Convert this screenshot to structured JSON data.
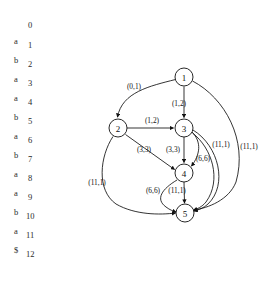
{
  "figure": {
    "background_color": "#ffffff",
    "ink_color": "#111111"
  },
  "string_column": {
    "indices": [
      "0",
      "1",
      "2",
      "3",
      "4",
      "5",
      "6",
      "7",
      "8",
      "9",
      "10",
      "11",
      "12"
    ],
    "characters": [
      "a",
      "b",
      "a",
      "a",
      "b",
      "a",
      "b",
      "a",
      "a",
      "b",
      "a",
      "$"
    ]
  },
  "graph": {
    "nodes": [
      {
        "id": "1",
        "label": "1",
        "cx": 184,
        "cy": 77,
        "r": 9
      },
      {
        "id": "2",
        "label": "2",
        "cx": 118,
        "cy": 128,
        "r": 9
      },
      {
        "id": "3",
        "label": "3",
        "cx": 184,
        "cy": 128,
        "r": 9
      },
      {
        "id": "4",
        "label": "4",
        "cx": 184,
        "cy": 173,
        "r": 9
      },
      {
        "id": "5",
        "label": "5",
        "cx": 185,
        "cy": 213,
        "r": 9
      }
    ],
    "edges": [
      {
        "from": "1",
        "to": "2",
        "label": "(0,1)",
        "label_x": 134,
        "label_y": 86
      },
      {
        "from": "1",
        "to": "3",
        "label": "(1,2)",
        "label_x": 179,
        "label_y": 103
      },
      {
        "from": "1",
        "to": "5",
        "label": "(11,1)",
        "label_x": 249,
        "label_y": 146
      },
      {
        "from": "2",
        "to": "3",
        "label": "(1,2)",
        "label_x": 152,
        "label_y": 120
      },
      {
        "from": "2",
        "to": "4",
        "label": "(3,3)",
        "label_x": 144,
        "label_y": 149
      },
      {
        "from": "2",
        "to": "5",
        "label": "(11,1)",
        "label_x": 97,
        "label_y": 182
      },
      {
        "from": "3",
        "to": "4",
        "label": "(3,3)",
        "label_x": 173,
        "label_y": 149
      },
      {
        "from": "3",
        "to": "4",
        "label": "(6,6)",
        "label_x": 203,
        "label_y": 158
      },
      {
        "from": "3",
        "to": "5",
        "label": "(11,1)",
        "label_x": 221,
        "label_y": 144
      },
      {
        "from": "4",
        "to": "5",
        "label": "(6,6)",
        "label_x": 153,
        "label_y": 190
      },
      {
        "from": "4",
        "to": "5",
        "label": "(11,1)",
        "label_x": 177,
        "label_y": 190
      }
    ]
  }
}
